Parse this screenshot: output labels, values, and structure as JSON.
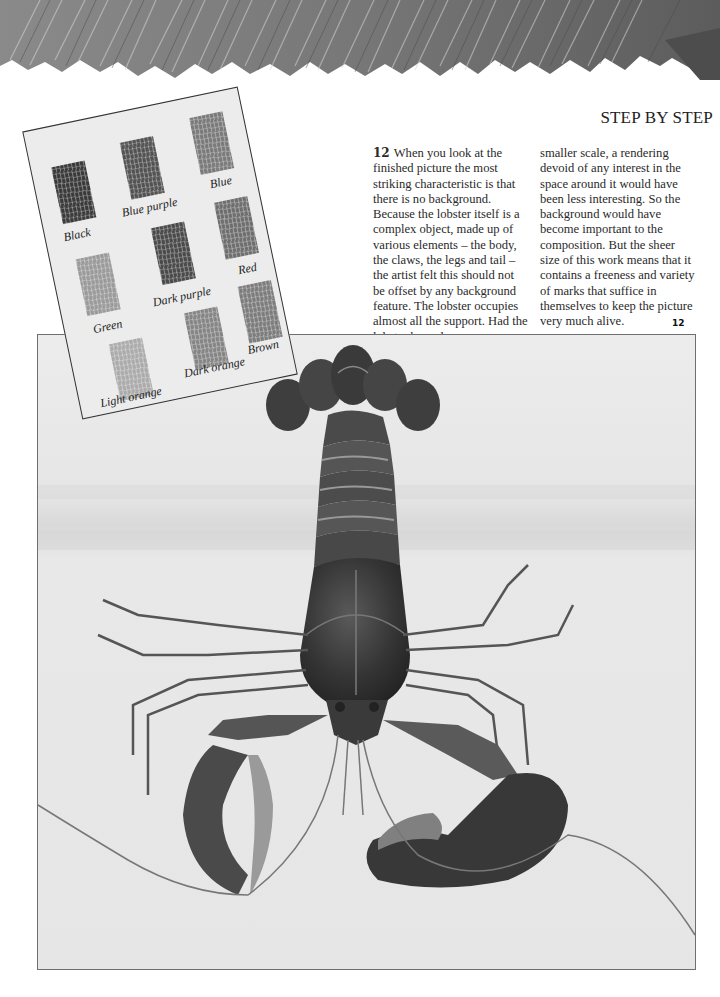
{
  "header": {
    "section_title": "STEP BY STEP"
  },
  "article": {
    "step_number": "12",
    "column1_lines": [
      "When you look at the",
      "finished picture the most",
      "striking characteristic is that",
      "there is no background.",
      "Because the lobster itself is a",
      "complex object, made up of",
      "various elements – the body,",
      "the claws, the legs and tail –",
      "the artist felt this should not",
      "be offset by any background",
      "feature. The lobster occupies",
      "almost all the support. Had the",
      "lobster been drawn on a"
    ],
    "column2_lines": [
      "smaller scale, a rendering",
      "devoid of any interest in the",
      "space around it would have",
      "been less interesting. So the",
      "background would have",
      "become important to the",
      "composition. But the sheer",
      "size of this work means that it",
      "contains a freeness and variety",
      "of marks that suffice in",
      "themselves to keep the picture",
      "very much alive."
    ]
  },
  "figure": {
    "label": "12"
  },
  "swatch_card": {
    "swatches": [
      {
        "label": "Black",
        "tone": "#3a3a3a"
      },
      {
        "label": "Blue purple",
        "tone": "#525252"
      },
      {
        "label": "Blue",
        "tone": "#7a7a7a"
      },
      {
        "label": "Green",
        "tone": "#9a9a9a"
      },
      {
        "label": "Dark purple",
        "tone": "#4a4a4a"
      },
      {
        "label": "Red",
        "tone": "#6e6e6e"
      },
      {
        "label": "Light orange",
        "tone": "#ababab"
      },
      {
        "label": "Dark orange",
        "tone": "#858585"
      },
      {
        "label": "Brown",
        "tone": "#7c7c7c"
      }
    ]
  }
}
